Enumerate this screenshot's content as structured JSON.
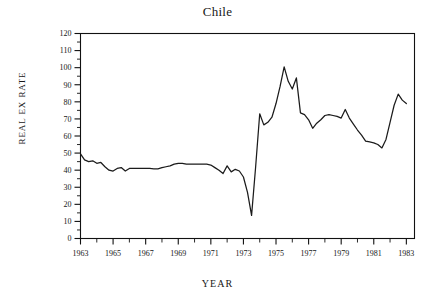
{
  "chart_data": {
    "type": "line",
    "title": "Chile",
    "xlabel": "YEAR",
    "ylabel": "REAL EX RATE",
    "xlim": [
      1963,
      1983.5
    ],
    "ylim": [
      0,
      120
    ],
    "grid": false,
    "legend": null,
    "y_ticks_major": [
      0,
      10,
      20,
      30,
      40,
      50,
      60,
      70,
      80,
      90,
      100,
      110,
      120
    ],
    "y_tick_labels": [
      "0",
      "10",
      "20",
      "30",
      "40",
      "50",
      "60",
      "70",
      "80",
      "90",
      "100",
      "110",
      "120"
    ],
    "y_ticks_minor": [
      5,
      15,
      25,
      35,
      45,
      55,
      65,
      75,
      85,
      95,
      105,
      115
    ],
    "x_ticks_major": [
      1963,
      1964,
      1965,
      1966,
      1967,
      1968,
      1969,
      1970,
      1971,
      1972,
      1973,
      1974,
      1975,
      1976,
      1977,
      1978,
      1979,
      1980,
      1981,
      1982,
      1983
    ],
    "x_tick_labels": [
      "1963",
      "",
      "1965",
      "",
      "1967",
      "",
      "1969",
      "",
      "1971",
      "",
      "1973",
      "",
      "1975",
      "",
      "1977",
      "",
      "1979",
      "",
      "1981",
      "",
      "1983"
    ],
    "series": [
      {
        "name": "REAL EX RATE",
        "color": "#1b1b1b",
        "x": [
          1963.0,
          1963.25,
          1963.5,
          1963.75,
          1964.0,
          1964.25,
          1964.5,
          1964.75,
          1965.0,
          1965.25,
          1965.5,
          1965.75,
          1966.0,
          1966.25,
          1966.5,
          1966.75,
          1967.0,
          1967.25,
          1967.5,
          1967.75,
          1968.0,
          1968.25,
          1968.5,
          1968.75,
          1969.0,
          1969.25,
          1969.5,
          1969.75,
          1970.0,
          1970.25,
          1970.5,
          1970.75,
          1971.0,
          1971.25,
          1971.5,
          1971.75,
          1972.0,
          1972.25,
          1972.5,
          1972.75,
          1973.0,
          1973.25,
          1973.5,
          1973.75,
          1974.0,
          1974.25,
          1974.5,
          1974.75,
          1975.0,
          1975.25,
          1975.5,
          1975.75,
          1976.0,
          1976.25,
          1976.5,
          1976.75,
          1977.0,
          1977.25,
          1977.5,
          1977.75,
          1978.0,
          1978.25,
          1978.5,
          1978.75,
          1979.0,
          1979.25,
          1979.5,
          1979.75,
          1980.0,
          1980.25,
          1980.5,
          1980.75,
          1981.0,
          1981.25,
          1981.5,
          1981.75,
          1982.0,
          1982.25,
          1982.5,
          1982.75,
          1983.0
        ],
        "y": [
          49.5,
          46.0,
          45.0,
          45.5,
          44.0,
          44.5,
          42.0,
          40.0,
          39.5,
          41.0,
          41.5,
          39.5,
          41.0,
          41.0,
          41.0,
          41.0,
          41.0,
          41.0,
          40.8,
          40.8,
          41.5,
          42.0,
          42.5,
          43.5,
          44.0,
          44.0,
          43.5,
          43.5,
          43.5,
          43.5,
          43.5,
          43.5,
          43.0,
          41.5,
          40.0,
          38.0,
          42.5,
          39.0,
          40.5,
          39.5,
          36.0,
          27.0,
          13.5,
          42.0,
          73.0,
          66.5,
          68.0,
          71.0,
          79.0,
          89.0,
          100.5,
          92.0,
          87.5,
          94.0,
          73.5,
          72.5,
          69.5,
          64.5,
          67.5,
          69.5,
          72.0,
          72.5,
          72.0,
          71.5,
          70.5,
          75.5,
          70.5,
          67.0,
          63.5,
          60.5,
          57.0,
          56.5,
          56.0,
          55.0,
          53.0,
          58.0,
          68.0,
          78.0,
          84.5,
          81.0,
          79.0
        ]
      }
    ]
  }
}
